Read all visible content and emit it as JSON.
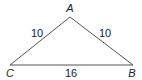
{
  "diagram": {
    "type": "triangle",
    "vertices": {
      "A": {
        "label": "A",
        "x": 70,
        "y": 17
      },
      "B": {
        "label": "B",
        "x": 133,
        "y": 65
      },
      "C": {
        "label": "C",
        "x": 10,
        "y": 65
      }
    },
    "sides": {
      "CA": {
        "label": "10"
      },
      "AB": {
        "label": "10"
      },
      "CB": {
        "label": "16"
      }
    },
    "line_color": "#555555"
  }
}
